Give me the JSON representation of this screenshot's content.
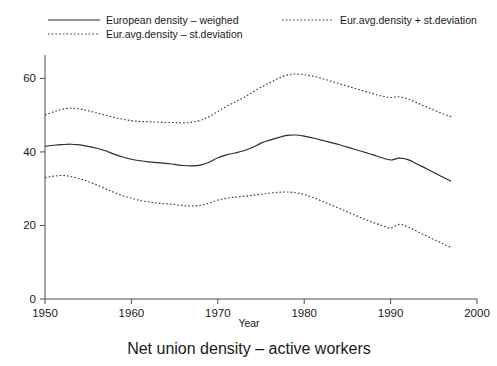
{
  "figure": {
    "caption": "Net union density – active workers",
    "background": "#ffffff",
    "line_color": "#2b2b2b",
    "axis_color": "#4d4d4d"
  },
  "legend": {
    "position": "top",
    "entries": [
      {
        "label": "European density – weighed",
        "style": "solid",
        "column": 0,
        "row": 0
      },
      {
        "label": "Eur.avg.density + st.deviation",
        "style": "dotted",
        "column": 1,
        "row": 0
      },
      {
        "label": "Eur.avg.density – st.deviation",
        "style": "dotted",
        "column": 0,
        "row": 1
      }
    ]
  },
  "chart_data": {
    "type": "line",
    "title": "",
    "caption": "Net union density – active workers",
    "xlabel": "Year",
    "ylabel": "",
    "xlim": [
      1950,
      2000
    ],
    "ylim": [
      0,
      65
    ],
    "xticks": [
      1950,
      1960,
      1970,
      1980,
      1990,
      2000
    ],
    "xticklabels": [
      "1950",
      "1960",
      "1970",
      "1980",
      "1990",
      "2000"
    ],
    "yticks": [
      0,
      20,
      40,
      60
    ],
    "yticklabels": [
      "0",
      "20",
      "40",
      "60"
    ],
    "grid": false,
    "x": [
      1950,
      1951,
      1952,
      1953,
      1954,
      1955,
      1956,
      1957,
      1958,
      1959,
      1960,
      1961,
      1962,
      1963,
      1964,
      1965,
      1966,
      1967,
      1968,
      1969,
      1970,
      1971,
      1972,
      1973,
      1974,
      1975,
      1976,
      1977,
      1978,
      1979,
      1980,
      1981,
      1982,
      1983,
      1984,
      1985,
      1986,
      1987,
      1988,
      1989,
      1990,
      1991,
      1992,
      1993,
      1994,
      1995,
      1996,
      1997
    ],
    "series": [
      {
        "name": "European density – weighed",
        "style": "solid",
        "values": [
          41.5,
          41.8,
          42.0,
          42.1,
          41.9,
          41.5,
          41.0,
          40.3,
          39.4,
          38.6,
          38.0,
          37.6,
          37.3,
          37.1,
          36.9,
          36.6,
          36.3,
          36.2,
          36.4,
          37.2,
          38.4,
          39.2,
          39.7,
          40.3,
          41.2,
          42.4,
          43.2,
          43.9,
          44.5,
          44.6,
          44.3,
          43.8,
          43.2,
          42.6,
          42.0,
          41.3,
          40.6,
          39.9,
          39.2,
          38.4,
          37.8,
          38.3,
          37.9,
          36.8,
          35.6,
          34.4,
          33.2,
          32.0
        ]
      },
      {
        "name": "Eur.avg.density + st.deviation",
        "style": "dotted",
        "values": [
          50.0,
          50.9,
          51.6,
          51.9,
          51.7,
          51.2,
          50.6,
          50.0,
          49.4,
          48.9,
          48.5,
          48.3,
          48.2,
          48.1,
          48.0,
          48.0,
          47.9,
          48.1,
          48.6,
          49.6,
          51.0,
          52.4,
          53.6,
          54.8,
          56.2,
          57.6,
          58.8,
          60.0,
          60.9,
          61.2,
          61.0,
          60.6,
          60.0,
          59.3,
          58.6,
          57.9,
          57.2,
          56.5,
          55.8,
          55.2,
          54.8,
          55.0,
          54.4,
          53.4,
          52.4,
          51.4,
          50.4,
          49.6
        ]
      },
      {
        "name": "Eur.avg.density – st.deviation",
        "style": "dotted",
        "values": [
          33.0,
          33.4,
          33.6,
          33.3,
          32.7,
          31.9,
          31.0,
          30.0,
          29.0,
          28.1,
          27.4,
          26.8,
          26.4,
          26.1,
          25.9,
          25.7,
          25.4,
          25.3,
          25.5,
          26.1,
          26.9,
          27.4,
          27.7,
          27.9,
          28.2,
          28.5,
          28.8,
          29.0,
          29.1,
          28.9,
          28.4,
          27.6,
          26.7,
          25.7,
          24.7,
          23.7,
          22.7,
          21.7,
          20.8,
          20.0,
          19.3,
          20.3,
          19.6,
          18.5,
          17.3,
          16.2,
          15.1,
          14.0
        ]
      }
    ]
  }
}
